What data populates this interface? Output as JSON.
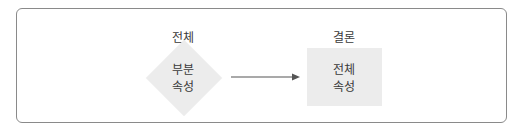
{
  "diagram": {
    "left_node": {
      "heading": "전체",
      "shape": "diamond",
      "lines": [
        "부분",
        "속성"
      ]
    },
    "right_node": {
      "heading": "결론",
      "shape": "square",
      "lines": [
        "전체",
        "속성"
      ]
    },
    "edge": {
      "from": "left_node",
      "to": "right_node",
      "style": "arrow"
    },
    "colors": {
      "border": "#8a8a8a",
      "node_fill": "#ececec",
      "text": "#3a3a3a",
      "arrow": "#555555"
    }
  }
}
